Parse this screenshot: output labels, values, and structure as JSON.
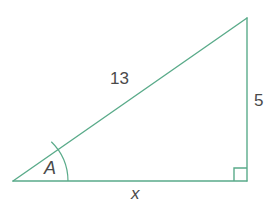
{
  "figure": {
    "type": "right-triangle-diagram",
    "background_color": "#ffffff",
    "stroke_color": "#5aab8a",
    "label_color": "#4a4a4a",
    "stroke_width": 1.4,
    "vertices": {
      "left": {
        "x": 13,
        "y": 181
      },
      "top_right": {
        "x": 247,
        "y": 18
      },
      "bottom_right": {
        "x": 247,
        "y": 181
      }
    },
    "markers": {
      "angle_arc": {
        "name": "angle-A-arc",
        "center": {
          "x": 13,
          "y": 181
        },
        "radius": 55
      },
      "right_angle": {
        "name": "right-angle-square",
        "size": 13
      }
    },
    "labels": {
      "hypotenuse": "13",
      "opposite": "5",
      "adjacent": "x",
      "angle": "A"
    },
    "label_names": {
      "hypotenuse": "hypotenuse-length-label",
      "opposite": "opposite-side-length-label",
      "adjacent": "adjacent-side-length-label",
      "angle": "angle-label"
    }
  }
}
